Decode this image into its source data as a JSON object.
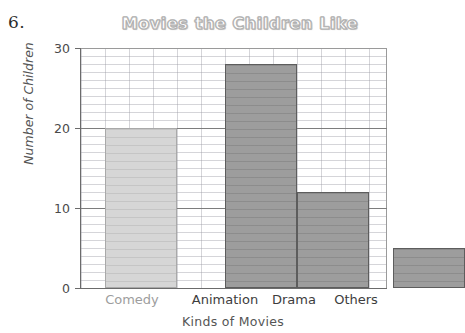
{
  "problem": {
    "number": "6."
  },
  "chart_data": {
    "type": "bar",
    "title": "Movies the Children Like",
    "xlabel": "Kinds of Movies",
    "ylabel": "Number of Children",
    "categories": [
      "Comedy",
      "Animation",
      "Drama",
      "Others"
    ],
    "values": [
      20,
      28,
      12,
      5
    ],
    "ylim": [
      0,
      30
    ],
    "y_ticks": [
      "0",
      "10",
      "20",
      "30"
    ],
    "y_tick_values": [
      0,
      10,
      20,
      30
    ],
    "grid": "on",
    "grid_minor_step": 1,
    "grid_major_values": [
      10,
      20
    ],
    "legend": "none",
    "bar_colors": [
      "#d6d6d6",
      "#9d9d9d",
      "#9d9d9d",
      "#9d9d9d"
    ],
    "title_color": "#b0b0b0",
    "axis_color": "#6b6b6b"
  }
}
